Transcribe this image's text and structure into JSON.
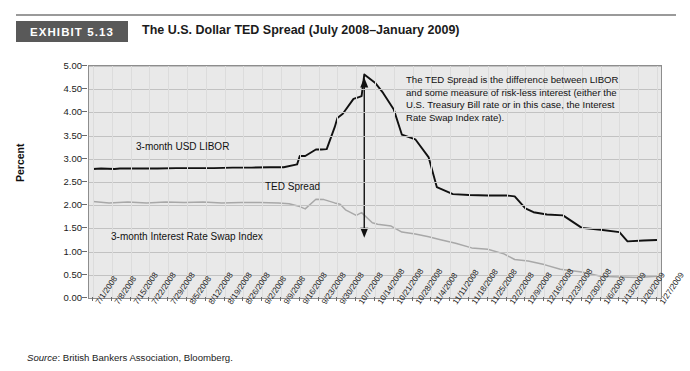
{
  "exhibit": {
    "badge": "EXHIBIT 5.13",
    "title": "The U.S. Dollar TED Spread (July 2008–January 2009)"
  },
  "source": {
    "label": "Source",
    "text": ": British Bankers Association, Bloomberg."
  },
  "labels": {
    "libor": "3-month USD LIBOR",
    "ted": "TED Spread",
    "swap": "3-month Interest Rate Swap Index",
    "annotation": "The TED Spread is the difference between LIBOR and some measure of risk-less interest (either the U.S. Treasury Bill rate or in this case, the Interest Rate Swap Index rate)."
  },
  "colors": {
    "badge_bg": "#595959",
    "plot_bg": "#e9e9e9",
    "grid": "#c2c2c2",
    "libor": "#111111",
    "swap": "#a8a8a8",
    "arrow": "#111111"
  },
  "chart_data": {
    "type": "line",
    "title": "The U.S. Dollar TED Spread (July 2008–January 2009)",
    "xlabel": "",
    "ylabel": "Percent",
    "ylim": [
      0.0,
      5.0
    ],
    "ytick_values": [
      0.0,
      0.5,
      1.0,
      1.5,
      2.0,
      2.5,
      3.0,
      3.5,
      4.0,
      4.5,
      5.0
    ],
    "ytick_labels": [
      "0.00",
      "0.50",
      "1.00",
      "1.50",
      "2.00",
      "2.50",
      "3.00",
      "3.50",
      "4.00",
      "4.50",
      "5.00"
    ],
    "grid": true,
    "legend": "in-plot annotations",
    "categories": [
      "7/1/2008",
      "7/8/2008",
      "7/15/2008",
      "7/22/2008",
      "7/29/2008",
      "8/5/2008",
      "8/12/2008",
      "8/19/2008",
      "8/26/2008",
      "9/2/2008",
      "9/9/2008",
      "9/16/2008",
      "9/23/2008",
      "9/30/2008",
      "10/7/2008",
      "10/14/2008",
      "10/21/2008",
      "10/28/2008",
      "11/4/2008",
      "11/11/2008",
      "11/18/2008",
      "11/25/2008",
      "12/2/2008",
      "12/9/2008",
      "12/16/2008",
      "12/23/2008",
      "12/30/2008",
      "1/6/2009",
      "1/13/2009",
      "1/20/2009",
      "1/27/2009"
    ],
    "series": [
      {
        "name": "3-month USD LIBOR",
        "color": "#111111",
        "values": [
          2.78,
          2.79,
          2.79,
          2.79,
          2.8,
          2.8,
          2.8,
          2.81,
          2.81,
          2.82,
          2.82,
          3.06,
          3.2,
          3.88,
          4.33,
          4.75,
          4.42,
          3.52,
          2.39,
          2.24,
          2.22,
          2.21,
          2.21,
          1.93,
          1.8,
          1.51,
          1.47,
          1.42,
          1.34,
          1.22,
          1.25
        ],
        "points": [
          {
            "x": "7/1/2008",
            "y": 2.78
          },
          {
            "x": "7/4/2008",
            "y": 2.79
          },
          {
            "x": "7/9/2008",
            "y": 2.78
          },
          {
            "x": "7/11/2008",
            "y": 2.79
          },
          {
            "x": "7/18/2008",
            "y": 2.79
          },
          {
            "x": "7/25/2008",
            "y": 2.79
          },
          {
            "x": "8/1/2008",
            "y": 2.8
          },
          {
            "x": "8/8/2008",
            "y": 2.8
          },
          {
            "x": "8/15/2008",
            "y": 2.8
          },
          {
            "x": "8/22/2008",
            "y": 2.81
          },
          {
            "x": "8/29/2008",
            "y": 2.81
          },
          {
            "x": "9/5/2008",
            "y": 2.82
          },
          {
            "x": "9/10/2008",
            "y": 2.82
          },
          {
            "x": "9/15/2008",
            "y": 2.88
          },
          {
            "x": "9/16/2008",
            "y": 3.06
          },
          {
            "x": "9/18/2008",
            "y": 3.06
          },
          {
            "x": "9/22/2008",
            "y": 3.2
          },
          {
            "x": "9/24/2008",
            "y": 3.2
          },
          {
            "x": "9/26/2008",
            "y": 3.21
          },
          {
            "x": "9/29/2008",
            "y": 3.68
          },
          {
            "x": "9/30/2008",
            "y": 3.88
          },
          {
            "x": "10/2/2008",
            "y": 3.97
          },
          {
            "x": "10/6/2008",
            "y": 4.29
          },
          {
            "x": "10/8/2008",
            "y": 4.33
          },
          {
            "x": "10/9/2008",
            "y": 4.35
          },
          {
            "x": "10/10/2008",
            "y": 4.82
          },
          {
            "x": "10/14/2008",
            "y": 4.64
          },
          {
            "x": "10/17/2008",
            "y": 4.42
          },
          {
            "x": "10/21/2008",
            "y": 4.06
          },
          {
            "x": "10/24/2008",
            "y": 3.52
          },
          {
            "x": "10/29/2008",
            "y": 3.42
          },
          {
            "x": "11/3/2008",
            "y": 3.03
          },
          {
            "x": "11/6/2008",
            "y": 2.39
          },
          {
            "x": "11/12/2008",
            "y": 2.24
          },
          {
            "x": "11/18/2008",
            "y": 2.22
          },
          {
            "x": "11/25/2008",
            "y": 2.21
          },
          {
            "x": "12/2/2008",
            "y": 2.21
          },
          {
            "x": "12/5/2008",
            "y": 2.19
          },
          {
            "x": "12/9/2008",
            "y": 1.93
          },
          {
            "x": "12/12/2008",
            "y": 1.85
          },
          {
            "x": "12/17/2008",
            "y": 1.8
          },
          {
            "x": "12/23/2008",
            "y": 1.78
          },
          {
            "x": "12/30/2008",
            "y": 1.51
          },
          {
            "x": "1/6/2009",
            "y": 1.47
          },
          {
            "x": "1/13/2009",
            "y": 1.42
          },
          {
            "x": "1/16/2009",
            "y": 1.22
          },
          {
            "x": "1/22/2009",
            "y": 1.24
          },
          {
            "x": "1/27/2009",
            "y": 1.25
          }
        ]
      },
      {
        "name": "3-month Interest Rate Swap Index",
        "color": "#a8a8a8",
        "values": [
          2.08,
          2.06,
          2.05,
          2.07,
          2.06,
          2.07,
          2.06,
          2.07,
          2.06,
          2.06,
          2.04,
          1.97,
          2.13,
          2.02,
          1.78,
          1.62,
          1.55,
          1.42,
          1.26,
          1.18,
          1.05,
          0.95,
          0.83,
          0.72,
          0.62,
          0.56,
          0.47,
          0.45,
          0.44,
          0.45,
          0.47
        ],
        "points": [
          {
            "x": "7/1/2008",
            "y": 2.08
          },
          {
            "x": "7/7/2008",
            "y": 2.05
          },
          {
            "x": "7/14/2008",
            "y": 2.07
          },
          {
            "x": "7/21/2008",
            "y": 2.05
          },
          {
            "x": "7/28/2008",
            "y": 2.07
          },
          {
            "x": "8/4/2008",
            "y": 2.06
          },
          {
            "x": "8/11/2008",
            "y": 2.07
          },
          {
            "x": "8/18/2008",
            "y": 2.05
          },
          {
            "x": "8/25/2008",
            "y": 2.06
          },
          {
            "x": "9/1/2008",
            "y": 2.06
          },
          {
            "x": "9/8/2008",
            "y": 2.05
          },
          {
            "x": "9/12/2008",
            "y": 2.03
          },
          {
            "x": "9/16/2008",
            "y": 1.97
          },
          {
            "x": "9/18/2008",
            "y": 1.92
          },
          {
            "x": "9/22/2008",
            "y": 2.13
          },
          {
            "x": "9/25/2008",
            "y": 2.12
          },
          {
            "x": "9/29/2008",
            "y": 2.05
          },
          {
            "x": "10/1/2008",
            "y": 2.02
          },
          {
            "x": "10/3/2008",
            "y": 1.9
          },
          {
            "x": "10/7/2008",
            "y": 1.78
          },
          {
            "x": "10/9/2008",
            "y": 1.84
          },
          {
            "x": "10/13/2008",
            "y": 1.62
          },
          {
            "x": "10/15/2008",
            "y": 1.59
          },
          {
            "x": "10/20/2008",
            "y": 1.55
          },
          {
            "x": "10/24/2008",
            "y": 1.42
          },
          {
            "x": "10/29/2008",
            "y": 1.38
          },
          {
            "x": "11/3/2008",
            "y": 1.32
          },
          {
            "x": "11/7/2008",
            "y": 1.26
          },
          {
            "x": "11/13/2008",
            "y": 1.18
          },
          {
            "x": "11/19/2008",
            "y": 1.08
          },
          {
            "x": "11/25/2008",
            "y": 1.05
          },
          {
            "x": "12/1/2008",
            "y": 0.95
          },
          {
            "x": "12/5/2008",
            "y": 0.83
          },
          {
            "x": "12/10/2008",
            "y": 0.8
          },
          {
            "x": "12/16/2008",
            "y": 0.72
          },
          {
            "x": "12/22/2008",
            "y": 0.62
          },
          {
            "x": "12/30/2008",
            "y": 0.56
          },
          {
            "x": "1/6/2009",
            "y": 0.47
          },
          {
            "x": "1/13/2009",
            "y": 0.45
          },
          {
            "x": "1/20/2009",
            "y": 0.44
          },
          {
            "x": "1/27/2009",
            "y": 0.47
          }
        ]
      }
    ],
    "annotations": [
      {
        "type": "double-arrow",
        "label": "TED Spread",
        "at_x": "10/10/2008",
        "y_top": 4.75,
        "y_bottom": 1.3
      }
    ]
  }
}
